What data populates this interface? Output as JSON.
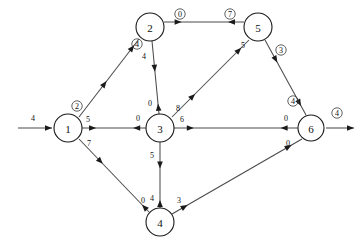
{
  "diagram": {
    "type": "directed-network-flow-graph",
    "colors": {
      "node_fill": "#ffffff",
      "node_stroke": "#1a1a1a",
      "edge_stroke": "#4a4a4a",
      "label_text": "#111111"
    },
    "nodes": [
      {
        "id": "1",
        "label": "1",
        "x": 68,
        "y": 128,
        "r": 14
      },
      {
        "id": "2",
        "label": "2",
        "x": 150,
        "y": 27,
        "r": 14
      },
      {
        "id": "3",
        "label": "3",
        "x": 160,
        "y": 128,
        "r": 14
      },
      {
        "id": "4",
        "label": "4",
        "x": 160,
        "y": 222,
        "r": 14
      },
      {
        "id": "5",
        "label": "5",
        "x": 258,
        "y": 27,
        "r": 14
      },
      {
        "id": "6",
        "label": "6",
        "x": 311,
        "y": 128,
        "r": 13
      }
    ],
    "terminal_arrows": [
      {
        "name": "source-arrow",
        "label": "4",
        "circled": false,
        "x1": 18,
        "y1": 128,
        "x2": 52,
        "y2": 128,
        "label_x": 33,
        "label_y": 118
      },
      {
        "name": "sink-arrow",
        "label": "4",
        "circled": true,
        "x1": 326,
        "y1": 128,
        "x2": 354,
        "y2": 128,
        "label_x": 337,
        "label_y": 113
      }
    ],
    "edges": [
      {
        "name": "edge-1-2",
        "from": "1",
        "to": "2",
        "x1": 79,
        "y1": 117,
        "x2": 139,
        "y2": 39,
        "labels": [
          {
            "text": "2",
            "circled": true,
            "x": 77,
            "y": 106,
            "near": "1"
          },
          {
            "text": "4",
            "circled": true,
            "x": 137,
            "y": 44,
            "near": "2"
          }
        ],
        "arrows": [
          {
            "at": 0.46,
            "dir": "to"
          },
          {
            "at": 0.92,
            "dir": "to"
          }
        ]
      },
      {
        "name": "edge-1-3",
        "from": "1",
        "to": "3",
        "x1": 82,
        "y1": 128,
        "x2": 146,
        "y2": 128,
        "labels": [
          {
            "text": "5",
            "circled": false,
            "x": 88,
            "y": 119,
            "near": "1"
          },
          {
            "text": "0",
            "circled": false,
            "x": 138,
            "y": 118,
            "near": "3"
          }
        ],
        "arrows": [
          {
            "at": 0.22,
            "dir": "to"
          },
          {
            "at": 0.8,
            "dir": "from"
          }
        ]
      },
      {
        "name": "edge-1-4",
        "from": "1",
        "to": "4",
        "x1": 79,
        "y1": 139,
        "x2": 149,
        "y2": 212,
        "labels": [
          {
            "text": "7",
            "circled": false,
            "x": 89,
            "y": 143,
            "near": "1"
          },
          {
            "text": "0",
            "circled": false,
            "x": 143,
            "y": 200,
            "near": "4"
          }
        ],
        "arrows": [
          {
            "at": 0.34,
            "dir": "to"
          },
          {
            "at": 0.9,
            "dir": "from"
          }
        ]
      },
      {
        "name": "edge-2-3",
        "from": "2",
        "to": "3",
        "x1": 152,
        "y1": 41,
        "x2": 159,
        "y2": 114,
        "labels": [
          {
            "text": "4",
            "circled": false,
            "x": 144,
            "y": 56,
            "near": "2"
          },
          {
            "text": "0",
            "circled": false,
            "x": 150,
            "y": 103,
            "near": "3"
          }
        ],
        "arrows": [
          {
            "at": 0.42,
            "dir": "to"
          },
          {
            "at": 0.86,
            "dir": "from"
          }
        ]
      },
      {
        "name": "edge-2-5",
        "from": "2",
        "to": "5",
        "x1": 164,
        "y1": 22,
        "x2": 244,
        "y2": 22,
        "labels": [
          {
            "text": "0",
            "circled": true,
            "x": 180,
            "y": 14,
            "near": "2"
          },
          {
            "text": "7",
            "circled": true,
            "x": 230,
            "y": 14,
            "near": "5"
          }
        ],
        "arrows": [
          {
            "at": 0.22,
            "dir": "to"
          },
          {
            "at": 0.8,
            "dir": "from"
          }
        ]
      },
      {
        "name": "edge-3-5",
        "from": "3",
        "to": "5",
        "x1": 172,
        "y1": 117,
        "x2": 249,
        "y2": 40,
        "labels": [
          {
            "text": "8",
            "circled": false,
            "x": 178,
            "y": 108,
            "near": "3"
          },
          {
            "text": "5",
            "circled": false,
            "x": 243,
            "y": 45,
            "near": "5"
          }
        ],
        "arrows": [
          {
            "at": 0.3,
            "dir": "to"
          },
          {
            "at": 0.9,
            "dir": "to"
          }
        ]
      },
      {
        "name": "edge-3-4",
        "from": "3",
        "to": "4",
        "x1": 160,
        "y1": 142,
        "x2": 160,
        "y2": 208,
        "labels": [
          {
            "text": "5",
            "circled": false,
            "x": 152,
            "y": 155,
            "near": "3"
          },
          {
            "text": "4",
            "circled": false,
            "x": 152,
            "y": 198,
            "near": "4"
          }
        ],
        "arrows": [
          {
            "at": 0.4,
            "dir": "to"
          },
          {
            "at": 0.88,
            "dir": "from"
          }
        ]
      },
      {
        "name": "edge-3-6",
        "from": "3",
        "to": "6",
        "x1": 174,
        "y1": 128,
        "x2": 298,
        "y2": 128,
        "labels": [
          {
            "text": "6",
            "circled": false,
            "x": 182,
            "y": 119,
            "near": "3"
          },
          {
            "text": "0",
            "circled": false,
            "x": 286,
            "y": 118,
            "near": "6"
          }
        ],
        "arrows": [
          {
            "at": 0.16,
            "dir": "to"
          },
          {
            "at": 0.86,
            "dir": "from"
          }
        ]
      },
      {
        "name": "edge-4-6",
        "from": "4",
        "to": "6",
        "x1": 172,
        "y1": 214,
        "x2": 302,
        "y2": 139,
        "labels": [
          {
            "text": "3",
            "circled": false,
            "x": 179,
            "y": 200,
            "near": "4"
          },
          {
            "text": "0",
            "circled": false,
            "x": 288,
            "y": 143,
            "near": "6"
          }
        ],
        "arrows": [
          {
            "at": 0.12,
            "dir": "to"
          },
          {
            "at": 0.92,
            "dir": "to"
          }
        ]
      },
      {
        "name": "edge-5-6",
        "from": "5",
        "to": "6",
        "x1": 265,
        "y1": 40,
        "x2": 306,
        "y2": 115,
        "labels": [
          {
            "text": "3",
            "circled": true,
            "x": 281,
            "y": 50,
            "near": "5"
          },
          {
            "text": "4",
            "circled": true,
            "x": 293,
            "y": 101,
            "near": "6"
          }
        ],
        "arrows": [
          {
            "at": 0.3,
            "dir": "to"
          },
          {
            "at": 0.88,
            "dir": "to"
          }
        ]
      }
    ]
  }
}
